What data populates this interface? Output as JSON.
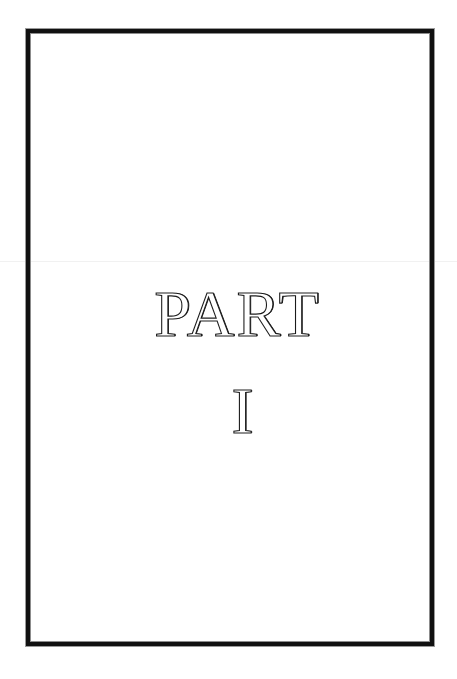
{
  "page": {
    "title_line_1": "PART",
    "title_line_2": "I",
    "frame": {
      "style": "double-rule border",
      "outer_color": "#111111",
      "inner_color": "#8c8c8c"
    },
    "background_color": "#ffffff",
    "text_color": "#1a1a1a"
  }
}
